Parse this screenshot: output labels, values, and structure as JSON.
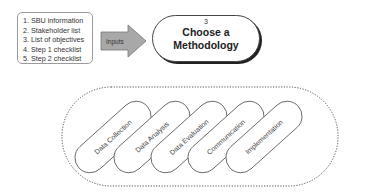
{
  "inputs_list": {
    "items": [
      "1. SBU information",
      "2. Stakeholder list",
      "3. List of objectives",
      "4. Step 1 checklist",
      "5. Step 2 checklist"
    ]
  },
  "arrow": {
    "label": "Inputs",
    "fill": "#a8a8a8"
  },
  "method": {
    "number": "3",
    "title_line1": "Choose a",
    "title_line2": "Methodology"
  },
  "activities": [
    {
      "label": "Data Collection"
    },
    {
      "label": "Data Analysis"
    },
    {
      "label": "Data Evaluation"
    },
    {
      "label": "Communication"
    },
    {
      "label": "Implementation"
    }
  ]
}
